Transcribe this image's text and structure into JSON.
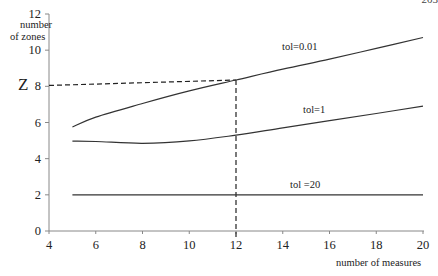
{
  "page_number_fragment": "203",
  "chart_data": {
    "type": "line",
    "title": "",
    "xlabel": "number of measures",
    "ylabel": "number of zones",
    "xlim": [
      4,
      20
    ],
    "ylim": [
      0,
      12
    ],
    "x_ticks": [
      4,
      6,
      8,
      10,
      12,
      14,
      16,
      18,
      20
    ],
    "y_ticks": [
      0,
      2,
      4,
      6,
      8,
      10,
      12
    ],
    "grid": false,
    "legend": "inline labels",
    "series": [
      {
        "name": "tol=0.01",
        "x": [
          5,
          6,
          8,
          10,
          12,
          14,
          16,
          18,
          20
        ],
        "values": [
          5.75,
          6.3,
          7.05,
          7.75,
          8.35,
          8.95,
          9.5,
          10.1,
          10.7
        ]
      },
      {
        "name": "tol=1",
        "x": [
          5,
          6,
          8,
          10,
          12,
          14,
          16,
          18,
          20
        ],
        "values": [
          4.97,
          4.95,
          4.85,
          4.98,
          5.3,
          5.7,
          6.1,
          6.5,
          6.9
        ]
      },
      {
        "name": "tol =20",
        "x": [
          5,
          20
        ],
        "values": [
          2.0,
          2.0
        ]
      }
    ],
    "annotations": [
      {
        "type": "dashed-guide",
        "label": "Z",
        "from_y_axis_value": 8.05,
        "to_point": [
          12,
          8.35
        ]
      },
      {
        "type": "dashed-vertical",
        "x": 12,
        "from_value": 8.35,
        "to_value": 0
      }
    ]
  },
  "labels": {
    "ylabel_line1": "number",
    "ylabel_line2": "of zones",
    "xlabel": "number of measures",
    "z_marker": "Z",
    "series_0": "tol=0.01",
    "series_1": "tol=1",
    "series_2": "tol =20"
  }
}
